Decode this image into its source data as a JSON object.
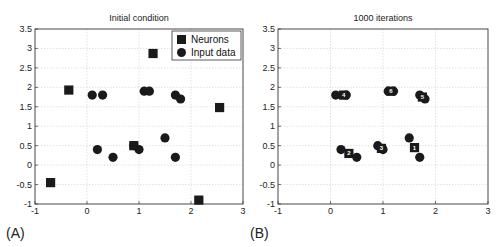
{
  "chart_data": [
    {
      "type": "scatter",
      "panel_label": "(A)",
      "title": "Initial condition",
      "xlabel": "",
      "ylabel": "",
      "xlim": [
        -1,
        3
      ],
      "ylim": [
        -1,
        3.5
      ],
      "xticks": [
        -1,
        0,
        1,
        2,
        3
      ],
      "yticks": [
        -1,
        -0.5,
        0,
        0.5,
        1,
        1.5,
        2,
        2.5,
        3,
        3.5
      ],
      "xtick_labels": [
        "-1",
        "0",
        "1",
        "2",
        "3"
      ],
      "ytick_labels": [
        "-1",
        "-0.5",
        "0",
        "0.5",
        "1",
        "1.5",
        "2",
        "2.5",
        "3",
        "3.5"
      ],
      "grid": true,
      "legend": {
        "position": "upper right",
        "entries": [
          "Neurons",
          "Input data"
        ]
      },
      "series": [
        {
          "name": "Neurons",
          "marker": "square",
          "points": [
            [
              -0.7,
              -0.45
            ],
            [
              -0.35,
              1.93
            ],
            [
              0.9,
              0.5
            ],
            [
              1.27,
              2.87
            ],
            [
              2.55,
              1.48
            ],
            [
              2.15,
              -0.9
            ]
          ]
        },
        {
          "name": "Input data",
          "marker": "circle",
          "points": [
            [
              0.1,
              1.8
            ],
            [
              0.3,
              1.8
            ],
            [
              1.1,
              1.9
            ],
            [
              1.2,
              1.9
            ],
            [
              1.7,
              1.8
            ],
            [
              1.8,
              1.7
            ],
            [
              0.2,
              0.4
            ],
            [
              0.5,
              0.2
            ],
            [
              0.9,
              0.5
            ],
            [
              1.0,
              0.4
            ],
            [
              1.5,
              0.7
            ],
            [
              1.7,
              0.2
            ]
          ]
        }
      ]
    },
    {
      "type": "scatter",
      "panel_label": "(B)",
      "title": "1000 iterations",
      "xlabel": "",
      "ylabel": "",
      "xlim": [
        -1,
        3
      ],
      "ylim": [
        -1,
        3.5
      ],
      "xticks": [
        -1,
        0,
        1,
        2,
        3
      ],
      "yticks": [
        -1,
        -0.5,
        0,
        0.5,
        1,
        1.5,
        2,
        2.5,
        3,
        3.5
      ],
      "xtick_labels": [
        "-1",
        "0",
        "1",
        "2",
        "3"
      ],
      "ytick_labels": [
        "-1",
        "-0.5",
        "0",
        "0.5",
        "1",
        "1.5",
        "2",
        "2.5",
        "3",
        "3.5"
      ],
      "grid": true,
      "series": [
        {
          "name": "Neurons",
          "marker": "square",
          "points": [
            [
              1.6,
              0.45,
              "1"
            ],
            [
              0.35,
              0.3,
              "2"
            ],
            [
              0.97,
              0.43,
              "3"
            ],
            [
              0.25,
              1.8,
              "4"
            ],
            [
              1.75,
              1.75,
              "5"
            ],
            [
              1.15,
              1.9,
              "6"
            ]
          ]
        },
        {
          "name": "Input data",
          "marker": "circle",
          "points": [
            [
              0.1,
              1.8
            ],
            [
              0.3,
              1.8
            ],
            [
              1.1,
              1.9
            ],
            [
              1.2,
              1.9
            ],
            [
              1.7,
              1.8
            ],
            [
              1.8,
              1.7
            ],
            [
              0.2,
              0.4
            ],
            [
              0.5,
              0.2
            ],
            [
              0.9,
              0.5
            ],
            [
              1.0,
              0.4
            ],
            [
              1.5,
              0.7
            ],
            [
              1.7,
              0.2
            ]
          ]
        }
      ]
    }
  ],
  "colors": {
    "marker": "#1a1a1a",
    "grid": "#cfcfcf",
    "axis": "#333333",
    "neuron_label": "#ffffff"
  }
}
